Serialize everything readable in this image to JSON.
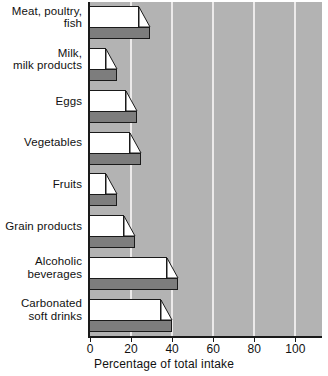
{
  "chart_data": {
    "type": "bar",
    "orientation": "horizontal",
    "title": "",
    "subtitle": "",
    "xlabel": "Percentage of total intake",
    "ylabel": "",
    "categories": [
      "Meat, poultry,\nfish",
      "Milk,\nmilk products",
      "Eggs",
      "Vegetables",
      "Fruits",
      "Grain products",
      "Alcoholic\nbeverages",
      "Carbonated\nsoft drinks"
    ],
    "values": [
      29,
      13,
      23,
      25,
      13,
      22,
      43,
      40
    ],
    "xlim": [
      0,
      113
    ],
    "xticks": [
      0,
      20,
      40,
      60,
      80,
      100
    ],
    "xticklabels": [
      "0",
      "20",
      "40",
      "60",
      "80",
      "100"
    ],
    "grid": true,
    "grid_axis": "x",
    "legend": null,
    "style": {
      "plot_background": "#b3b3b3",
      "gridline_color": "#eceaea",
      "bar_face_color": "#ffffff",
      "bar_shadow_color": "#7d7d7d",
      "bar_outline_color": "#1a1a1a",
      "axis_color": "#1a1a1a",
      "text_color": "#111111"
    }
  }
}
